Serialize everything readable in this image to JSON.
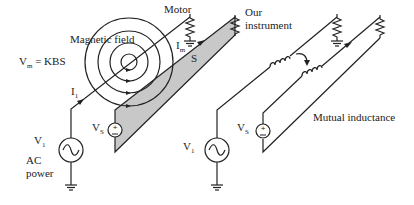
{
  "diagram": {
    "type": "circuit-schematic",
    "left_panel": {
      "equation": "V",
      "equation_sub": "m",
      "equation_rest": " = KBS",
      "field_label": "Magnetic field",
      "motor_label": "Motor",
      "current_source_label": "I",
      "current_source_sub": "1",
      "current_motor_label": "I",
      "current_motor_sub": "m",
      "spacing_label": "S",
      "source_label": "V",
      "source_sub": "1",
      "ac_label_1": "AC",
      "ac_label_2": "power",
      "vs_label": "V",
      "vs_sub": "S",
      "instrument_label_1": "Our",
      "instrument_label_2": "instrument"
    },
    "right_panel": {
      "source_label": "V",
      "source_sub": "1",
      "vs_label": "V",
      "vs_sub": "S",
      "coupling_label": "Mutual inductance"
    },
    "colors": {
      "line": "#222222",
      "plane_fill": "#c8c8c8",
      "background": "#ffffff"
    }
  }
}
